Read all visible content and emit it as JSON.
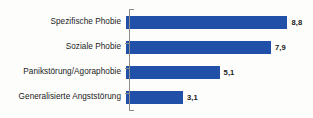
{
  "chart_data": {
    "type": "bar",
    "orientation": "horizontal",
    "title": "",
    "subtitle": "",
    "xlabel": "",
    "ylabel": "",
    "categories": [
      "Spezifische Phobie",
      "Soziale Phobie",
      "Panikstörung/Agoraphobie",
      "Generalisierte Angststörung"
    ],
    "values": [
      8.8,
      7.9,
      5.1,
      3.1
    ],
    "value_labels": [
      "8,8",
      "7,9",
      "5,1",
      "3,1"
    ],
    "xlim": [
      0,
      9.7
    ],
    "grid": false,
    "legend": false,
    "bar_color": "#2050a8",
    "axis_color": "#8d8d8d",
    "label_color": "#1b1b1b",
    "background_color": "#fdfdfc"
  }
}
